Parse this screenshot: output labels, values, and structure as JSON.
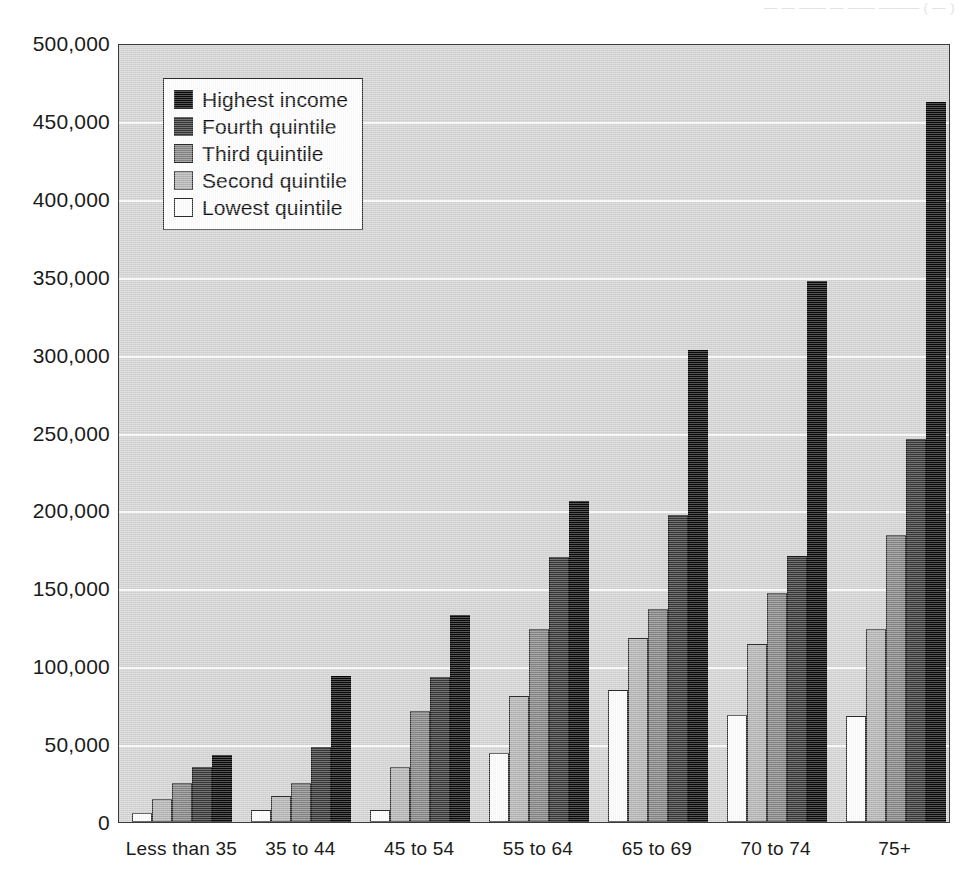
{
  "ghost_text": "— —  ——  — —— ——— ( — )",
  "chart_data": {
    "type": "bar",
    "title": "",
    "subtitle": "",
    "xlabel": "",
    "ylabel": "",
    "ylim": [
      0,
      500000
    ],
    "ytick_step": 50000,
    "grid": true,
    "legend_position": "upper-left-inside",
    "categories": [
      "Less than 35",
      "35 to 44",
      "45 to 54",
      "55 to 64",
      "65 to 69",
      "70 to 74",
      "75+"
    ],
    "ytick_labels": [
      "500,000",
      "450,000",
      "400,000",
      "350,000",
      "300,000",
      "250,000",
      "200,000",
      "150,000",
      "100,000",
      "50,000",
      "0"
    ],
    "ytick_values": [
      500000,
      450000,
      400000,
      350000,
      300000,
      250000,
      200000,
      150000,
      100000,
      50000,
      0
    ],
    "series": [
      {
        "name": "Highest income",
        "color": "#0a0a0a",
        "values": [
          43000,
          94000,
          133000,
          206000,
          303000,
          347000,
          462000
        ]
      },
      {
        "name": "Fourth quintile",
        "color": "#373737",
        "values": [
          35000,
          48000,
          93000,
          170000,
          197000,
          171000,
          246000
        ]
      },
      {
        "name": "Third quintile",
        "color": "#848484",
        "values": [
          25000,
          25000,
          71000,
          124000,
          137000,
          147000,
          184000
        ]
      },
      {
        "name": "Second quintile",
        "color": "#b4b4b4",
        "values": [
          15000,
          17000,
          35000,
          81000,
          118000,
          114000,
          124000
        ]
      },
      {
        "name": "Lowest quintile",
        "color": "#fdfdfd",
        "values": [
          6000,
          8000,
          8000,
          44000,
          85000,
          69000,
          68000
        ]
      }
    ],
    "series_draw_order": [
      "Lowest quintile",
      "Second quintile",
      "Third quintile",
      "Fourth quintile",
      "Highest income"
    ],
    "legend_entries": [
      {
        "label": "Highest income",
        "color": "#0a0a0a"
      },
      {
        "label": "Fourth quintile",
        "color": "#373737"
      },
      {
        "label": "Third quintile",
        "color": "#848484"
      },
      {
        "label": "Second quintile",
        "color": "#b4b4b4"
      },
      {
        "label": "Lowest quintile",
        "color": "#fdfdfd"
      }
    ],
    "plot_background": "#d4d4d4",
    "gridline_color": "#fbfbfb",
    "axis_color": "#2b2b2b"
  }
}
